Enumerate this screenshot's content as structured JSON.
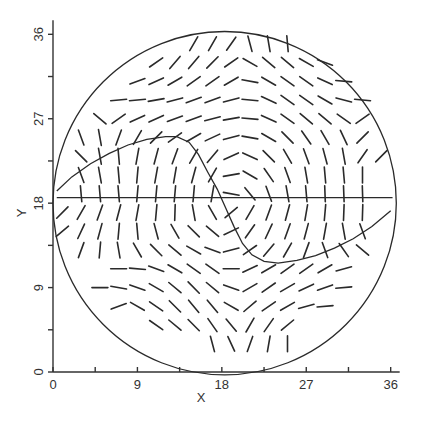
{
  "chart_data": {
    "type": "scatter",
    "subtype": "direction-field",
    "title": "",
    "xlabel": "X",
    "ylabel": "Y",
    "xlim": [
      0,
      36
    ],
    "ylim": [
      0,
      36
    ],
    "xticks": [
      0,
      9,
      18,
      27,
      36
    ],
    "yticks": [
      0,
      9,
      18,
      27,
      36
    ],
    "minor_tick_step": 4.5,
    "grid": false,
    "circle": {
      "cx": 18.3,
      "cy": 18.0,
      "r": 18.3
    },
    "horizontal_line": {
      "y": 18.6,
      "x_from": 0.4,
      "x_to": 36.2
    },
    "curve": [
      [
        0.4,
        19.3
      ],
      [
        2,
        20.8
      ],
      [
        4,
        22.2
      ],
      [
        6,
        23.3
      ],
      [
        8,
        24.2
      ],
      [
        10,
        24.8
      ],
      [
        12,
        25.1
      ],
      [
        13.2,
        25.1
      ],
      [
        14.5,
        24.5
      ],
      [
        15.5,
        23.2
      ],
      [
        16.5,
        21.3
      ],
      [
        17.5,
        19.5
      ],
      [
        18.4,
        17.5
      ],
      [
        19.3,
        15.5
      ],
      [
        20.2,
        13.7
      ],
      [
        21.2,
        12.5
      ],
      [
        22.5,
        11.8
      ],
      [
        24,
        11.6
      ],
      [
        26,
        11.9
      ],
      [
        28,
        12.4
      ],
      [
        30,
        13.2
      ],
      [
        32,
        14.2
      ],
      [
        34,
        15.5
      ],
      [
        36,
        17.2
      ]
    ],
    "field": {
      "x": [
        1,
        3,
        5,
        7,
        9,
        11,
        13,
        15,
        17,
        19,
        21,
        23,
        25,
        27,
        29,
        31,
        33,
        35
      ],
      "y": [
        35,
        33,
        31,
        29,
        27,
        25,
        23,
        21,
        19,
        17,
        15,
        13,
        11,
        9,
        7,
        5,
        3,
        1
      ],
      "segment_length": 2.0,
      "angles_deg": [
        [
          null,
          null,
          null,
          null,
          null,
          null,
          null,
          60,
          60,
          55,
          -75,
          -80,
          -85,
          null,
          null,
          null,
          null,
          null
        ],
        [
          null,
          null,
          null,
          null,
          null,
          35,
          50,
          50,
          45,
          35,
          -30,
          -40,
          -40,
          -30,
          -20,
          null,
          null,
          null
        ],
        [
          null,
          null,
          null,
          null,
          20,
          25,
          30,
          35,
          35,
          30,
          -10,
          -30,
          -35,
          -35,
          -25,
          -5,
          null,
          null
        ],
        [
          null,
          null,
          null,
          5,
          5,
          10,
          15,
          20,
          20,
          15,
          -5,
          -25,
          -35,
          -35,
          -30,
          -15,
          -5,
          null
        ],
        [
          null,
          null,
          -40,
          35,
          25,
          25,
          20,
          20,
          15,
          10,
          -5,
          -25,
          -35,
          -40,
          -40,
          -35,
          35,
          null
        ],
        [
          null,
          -70,
          -80,
          70,
          60,
          45,
          35,
          30,
          25,
          15,
          -10,
          -30,
          -45,
          -55,
          -60,
          -65,
          45,
          null
        ],
        [
          null,
          -45,
          -80,
          -85,
          80,
          75,
          70,
          60,
          50,
          25,
          -25,
          -45,
          -60,
          -70,
          -75,
          -80,
          55,
          45
        ],
        [
          null,
          -70,
          -80,
          -85,
          85,
          80,
          80,
          75,
          60,
          10,
          -30,
          -55,
          -70,
          -80,
          -85,
          -85,
          -90,
          null
        ],
        [
          null,
          -85,
          -85,
          -85,
          85,
          85,
          85,
          85,
          80,
          -10,
          -50,
          -70,
          -80,
          -85,
          -88,
          -88,
          -88,
          null
        ],
        [
          45,
          60,
          70,
          75,
          80,
          85,
          88,
          -80,
          -60,
          40,
          60,
          70,
          75,
          80,
          85,
          88,
          88,
          null
        ],
        [
          40,
          65,
          75,
          85,
          -85,
          -75,
          -60,
          -45,
          -40,
          25,
          55,
          65,
          70,
          75,
          80,
          -80,
          -70,
          null
        ],
        [
          null,
          70,
          85,
          -80,
          -60,
          -45,
          -40,
          -30,
          -20,
          15,
          35,
          50,
          60,
          70,
          -70,
          -55,
          -40,
          null
        ],
        [
          null,
          null,
          null,
          0,
          -5,
          -20,
          -30,
          -35,
          -35,
          0,
          25,
          30,
          35,
          35,
          30,
          15,
          null,
          null
        ],
        [
          null,
          null,
          0,
          -10,
          -20,
          -30,
          -40,
          -45,
          -40,
          -20,
          30,
          35,
          30,
          25,
          20,
          5,
          null,
          null
        ],
        [
          null,
          null,
          null,
          20,
          -30,
          -35,
          -45,
          -50,
          -50,
          -30,
          40,
          35,
          30,
          15,
          5,
          null,
          null,
          null
        ],
        [
          null,
          null,
          null,
          null,
          null,
          -35,
          -40,
          -45,
          -55,
          -50,
          60,
          55,
          40,
          null,
          null,
          null,
          null,
          null
        ],
        [
          null,
          null,
          null,
          null,
          null,
          null,
          null,
          null,
          -75,
          -65,
          70,
          80,
          90,
          null,
          null,
          null,
          null,
          null
        ],
        [
          null,
          null,
          null,
          null,
          null,
          null,
          null,
          null,
          null,
          null,
          null,
          null,
          null,
          null,
          null,
          null,
          null,
          null
        ]
      ]
    }
  },
  "axes": {
    "xlabel": "X",
    "ylabel": "Y",
    "xtick_labels": [
      "0",
      "9",
      "18",
      "27",
      "36"
    ],
    "ytick_labels": [
      "0",
      "9",
      "18",
      "27",
      "36"
    ]
  }
}
